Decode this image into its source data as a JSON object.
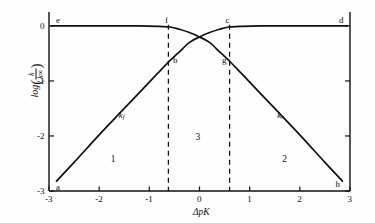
{
  "chart_data": {
    "type": "line",
    "title": "",
    "xlabel": "ΔpK",
    "ylabel": "log(k/k∞)",
    "xlim": [
      -3,
      3
    ],
    "ylim": [
      -3,
      0.18
    ],
    "grid": false,
    "legend_position": "inline-curve-labels",
    "xticks": [
      "-3",
      "-2",
      "-1",
      "0",
      "1",
      "2",
      "3"
    ],
    "xtick_values": [
      -3,
      -2,
      -1,
      0,
      1,
      2,
      3
    ],
    "yticks": [
      "0",
      "-1",
      "-2",
      "-3"
    ],
    "ytick_values": [
      0,
      -1,
      -2,
      -3
    ],
    "series": [
      {
        "name": "k_f",
        "label_text": "k",
        "label_sub": "f",
        "description": "forward rate constant: plateau at 0 for ΔpK > ~0.6, diffusion-limited descent on the left",
        "x": [
          -2.85,
          -2.5,
          -2.0,
          -1.5,
          -1.0,
          -0.8,
          -0.62,
          -0.4,
          -0.2,
          0.0,
          0.2,
          0.4,
          0.58,
          0.8,
          1.2,
          1.8,
          2.4,
          2.95
        ],
        "y": [
          -2.82,
          -2.48,
          -1.98,
          -1.5,
          -1.02,
          -0.83,
          -0.66,
          -0.47,
          -0.3,
          -0.2,
          -0.12,
          -0.06,
          -0.02,
          -0.01,
          0.0,
          0.0,
          0.0,
          0.0
        ]
      },
      {
        "name": "k_r",
        "label_text": "k",
        "label_sub": "r",
        "description": "reverse rate constant: plateau at 0 for ΔpK < ~-0.6, diffusion-limited descent on the right",
        "x": [
          -2.95,
          -2.4,
          -1.8,
          -1.2,
          -0.8,
          -0.58,
          -0.4,
          -0.2,
          0.0,
          0.2,
          0.4,
          0.62,
          0.8,
          1.0,
          1.5,
          2.0,
          2.5,
          2.85
        ],
        "y": [
          0.0,
          0.0,
          0.0,
          0.0,
          -0.01,
          -0.02,
          -0.06,
          -0.12,
          -0.2,
          -0.3,
          -0.47,
          -0.66,
          -0.83,
          -1.02,
          -1.5,
          -1.98,
          -2.48,
          -2.82
        ]
      }
    ],
    "dashed_verticals": [
      -0.62,
      0.6
    ],
    "point_labels": [
      {
        "id": "a",
        "text": "a",
        "x": -2.82,
        "y": -2.92,
        "note": "left end of k_f curve"
      },
      {
        "id": "b",
        "text": "b",
        "x": -0.48,
        "y": -0.62,
        "note": "k_f on left dashed line"
      },
      {
        "id": "c",
        "text": "c",
        "x": 0.56,
        "y": 0.1,
        "note": "k_f meets plateau, right dashed line"
      },
      {
        "id": "d",
        "text": "d",
        "x": 2.83,
        "y": 0.1,
        "note": "right end of plateau"
      },
      {
        "id": "e",
        "text": "e",
        "x": -2.82,
        "y": 0.1,
        "note": "left end of plateau"
      },
      {
        "id": "f",
        "text": "f",
        "x": -0.66,
        "y": 0.1,
        "note": "k_r meets plateau, left dashed line"
      },
      {
        "id": "g",
        "text": "g",
        "x": 0.5,
        "y": -0.62,
        "note": "k_r on right dashed line"
      },
      {
        "id": "h",
        "text": "h",
        "x": 2.76,
        "y": -2.88,
        "note": "right end of k_r curve"
      }
    ],
    "region_labels": [
      {
        "text": "1",
        "x": -1.72,
        "y": -2.42,
        "note": "region left of left dashed line"
      },
      {
        "text": "2",
        "x": 1.7,
        "y": -2.42,
        "note": "region right of right dashed line"
      },
      {
        "text": "3",
        "x": -0.03,
        "y": -2.02,
        "note": "region between dashed lines"
      }
    ],
    "curve_labels": [
      {
        "text": "k",
        "sub": "f",
        "x": -1.55,
        "y": -1.62
      },
      {
        "text": "k",
        "sub": "r",
        "x": 1.62,
        "y": -1.62
      }
    ]
  },
  "yaxis": {
    "log_text": "log",
    "numerator": "k",
    "denominator": "k∞"
  }
}
